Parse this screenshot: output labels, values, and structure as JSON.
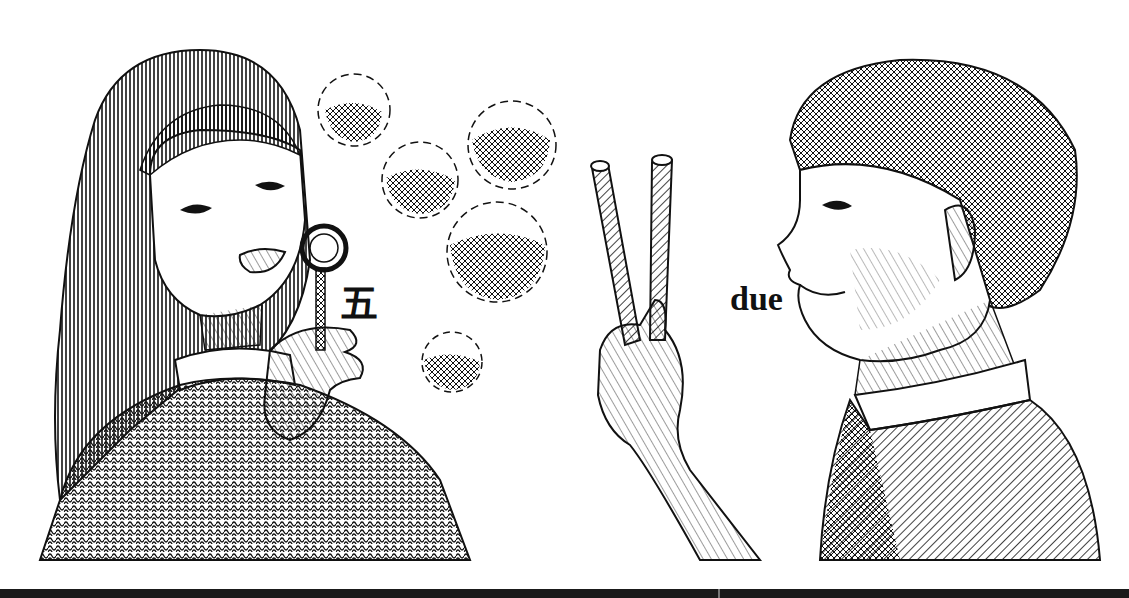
{
  "illustration": {
    "description": "Pen-and-ink illustration: a girl blowing bubbles with a bubble wand, and a boy holding up two fingers next to two straws",
    "left_figure": {
      "subject": "girl with long hair blowing bubbles",
      "label": "五",
      "label_meaning": "five (Chinese)",
      "bubble_count": 5
    },
    "right_figure": {
      "subject": "boy in profile holding up two fingers",
      "label": "due",
      "label_meaning": "two (Italian)",
      "straw_count": 2
    }
  },
  "colors": {
    "ink": "#111111",
    "paper": "#ffffff",
    "bar": "#1a1a1a"
  }
}
